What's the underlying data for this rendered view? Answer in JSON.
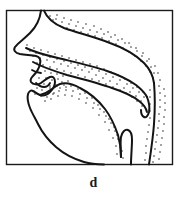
{
  "figure": {
    "caption": "d",
    "kind": "midsagittal-vocal-tract-diagram",
    "frame": {
      "x": 6.5,
      "y": 10.5,
      "width": 166,
      "height": 154,
      "stroke_color": "#1a1a1a",
      "stroke_width": 1.4,
      "fill_color": "#ffffff"
    },
    "colors": {
      "ink": "#111111",
      "outline": "#141414",
      "stipple": "#1a1a1a",
      "background": "#ffffff",
      "caption": "#1a1a1a"
    },
    "parts": [
      {
        "name": "nose-profile",
        "label": "nose"
      },
      {
        "name": "upper-lip",
        "label": "upper lip"
      },
      {
        "name": "lower-lip",
        "label": "lower lip"
      },
      {
        "name": "chin-jaw-contour",
        "label": "chin and jaw"
      },
      {
        "name": "nasal-cavity",
        "label": "nasal cavity"
      },
      {
        "name": "hard-palate",
        "label": "hard palate"
      },
      {
        "name": "alveolar-ridge",
        "label": "alveolar ridge"
      },
      {
        "name": "velum-soft-palate",
        "label": "velum"
      },
      {
        "name": "uvula",
        "label": "uvula"
      },
      {
        "name": "tongue-body",
        "label": "tongue"
      },
      {
        "name": "tongue-tip",
        "label": "tongue tip"
      },
      {
        "name": "pharyngeal-wall",
        "label": "pharynx"
      },
      {
        "name": "epiglottis",
        "label": "epiglottis"
      },
      {
        "name": "larynx-opening",
        "label": "larynx"
      }
    ],
    "stipple": {
      "dot_radius": 0.72,
      "description": "dotted shading band along tissue boundaries"
    }
  }
}
